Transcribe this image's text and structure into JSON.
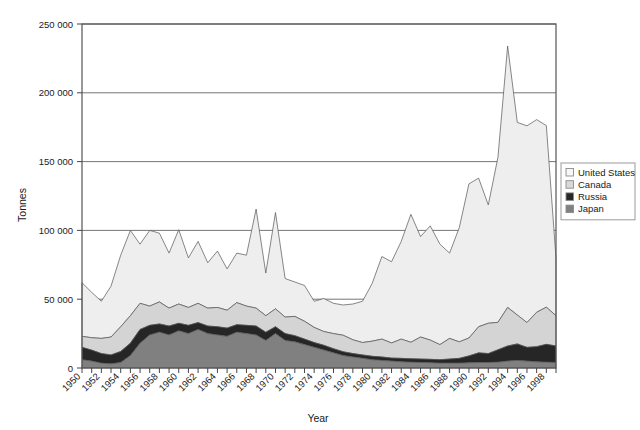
{
  "chart_data": {
    "type": "area",
    "stacked": true,
    "title": "",
    "xlabel": "Year",
    "ylabel": "Tonnes",
    "ylim": [
      0,
      250000
    ],
    "xlim": [
      1950,
      1999
    ],
    "ytick_values": [
      0,
      50000,
      100000,
      150000,
      200000,
      250000
    ],
    "ytick_labels": [
      "0",
      "50 000",
      "100 000",
      "150 000",
      "200 000",
      "250 000"
    ],
    "grid": "horizontal",
    "legend_position": "right",
    "x": [
      1950,
      1951,
      1952,
      1953,
      1954,
      1955,
      1956,
      1957,
      1958,
      1959,
      1960,
      1961,
      1962,
      1963,
      1964,
      1965,
      1966,
      1967,
      1968,
      1969,
      1970,
      1971,
      1972,
      1973,
      1974,
      1975,
      1976,
      1977,
      1978,
      1979,
      1980,
      1981,
      1982,
      1983,
      1984,
      1985,
      1986,
      1987,
      1988,
      1989,
      1990,
      1991,
      1992,
      1993,
      1994,
      1995,
      1996,
      1997,
      1998,
      1999
    ],
    "xtick_labels": [
      "1950",
      "1952",
      "1954",
      "1956",
      "1958",
      "1960",
      "1962",
      "1964",
      "1966",
      "1968",
      "1970",
      "1972",
      "1974",
      "1976",
      "1978",
      "1980",
      "1982",
      "1984",
      "1986",
      "1988",
      "1990",
      "1992",
      "1994",
      "1996",
      "1998"
    ],
    "series": [
      {
        "name": "Japan",
        "color": "#808080",
        "stack_order": 1,
        "values": [
          6000,
          5000,
          3500,
          3000,
          4000,
          9000,
          18000,
          24000,
          26000,
          24000,
          27000,
          25000,
          28000,
          25000,
          24000,
          23000,
          26000,
          25000,
          24000,
          20000,
          25000,
          20000,
          19000,
          17000,
          15000,
          13000,
          11000,
          9000,
          8000,
          7000,
          6000,
          5500,
          5000,
          4500,
          4200,
          4000,
          3800,
          3500,
          3500,
          3500,
          3800,
          4000,
          4000,
          4200,
          5000,
          5500,
          5000,
          4500,
          4200,
          4000
        ]
      },
      {
        "name": "Russia",
        "color": "#262626",
        "stack_order": 2,
        "values": [
          9000,
          8000,
          7000,
          6500,
          8000,
          9000,
          10000,
          7000,
          6000,
          6500,
          5500,
          6000,
          5000,
          5500,
          6000,
          6000,
          5500,
          6000,
          6500,
          6000,
          5000,
          5000,
          4500,
          4000,
          3500,
          3500,
          3000,
          2800,
          2500,
          2500,
          2500,
          2500,
          2200,
          2500,
          2500,
          2500,
          2500,
          2500,
          3000,
          3500,
          5000,
          7000,
          6500,
          9000,
          11000,
          12000,
          10000,
          11000,
          13000,
          12000
        ]
      },
      {
        "name": "Canada",
        "color": "#d4d4d4",
        "stack_order": 3,
        "values": [
          8000,
          9000,
          11000,
          13000,
          18000,
          20000,
          19000,
          14000,
          16000,
          13000,
          14000,
          13000,
          14000,
          13000,
          14000,
          13000,
          16000,
          14000,
          13000,
          12000,
          13000,
          12000,
          14000,
          13000,
          11000,
          10000,
          11000,
          12000,
          10000,
          9000,
          11000,
          13000,
          11000,
          14000,
          12000,
          16000,
          14000,
          11000,
          15000,
          12000,
          13000,
          19000,
          22000,
          20000,
          28000,
          21000,
          18000,
          25000,
          27000,
          22000
        ]
      },
      {
        "name": "United States",
        "color": "#eeeeee",
        "stack_order": 4,
        "values": [
          39000,
          33000,
          27000,
          37000,
          52000,
          62000,
          43000,
          55000,
          50000,
          40000,
          54000,
          36000,
          45000,
          33000,
          41000,
          30000,
          36000,
          37000,
          72000,
          31000,
          70000,
          28000,
          25000,
          26000,
          19000,
          24000,
          22000,
          22000,
          26000,
          30000,
          42000,
          60000,
          59000,
          71000,
          93000,
          73000,
          83000,
          73000,
          62000,
          83000,
          112000,
          108000,
          86000,
          120000,
          190000,
          140000,
          143000,
          140000,
          132000,
          42000
        ]
      }
    ],
    "series_totals": [
      62000,
      55000,
      48500,
      59500,
      82000,
      100000,
      90000,
      100000,
      98000,
      83500,
      100500,
      80000,
      92000,
      76500,
      85000,
      72000,
      83500,
      82000,
      115500,
      69000,
      113000,
      65000,
      62500,
      60000,
      48500,
      50500,
      47000,
      45800,
      46500,
      48500,
      61500,
      81000,
      77200,
      92000,
      111700,
      95500,
      103300,
      90000,
      83500,
      102000,
      133800,
      138000,
      118500,
      153200,
      234000,
      178500,
      176000,
      180500,
      176200,
      80000
    ]
  },
  "legend": {
    "items": [
      {
        "label": "United States",
        "swatch": "#f7f7f7"
      },
      {
        "label": "Canada",
        "swatch": "#d9d9d9"
      },
      {
        "label": "Russia",
        "swatch": "#262626"
      },
      {
        "label": "Japan",
        "swatch": "#808080"
      }
    ]
  },
  "axes": {
    "y_title": "Tonnes",
    "x_title": "Year"
  }
}
